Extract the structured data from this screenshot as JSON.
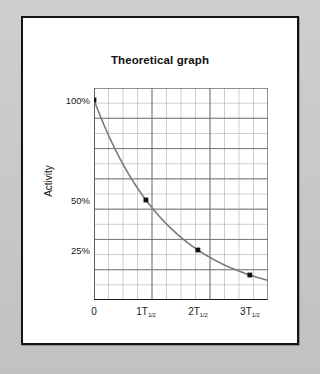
{
  "page": {
    "background_color": "#c9c9c9",
    "card_background": "#ffffff",
    "card_border_color": "#131313"
  },
  "chart_data": {
    "type": "line",
    "title": "Theoretical graph",
    "xlabel": "",
    "ylabel": "Activity",
    "grid": true,
    "legend": "none",
    "x_tick_labels": [
      "0",
      "1T1/2",
      "2T1/2",
      "3T1/2"
    ],
    "x_tick_display": [
      {
        "main": "0",
        "sub": ""
      },
      {
        "main": "1T",
        "sub": "1/2"
      },
      {
        "main": "2T",
        "sub": "1/2"
      },
      {
        "main": "3T",
        "sub": "1/2"
      }
    ],
    "x_tick_values": [
      0,
      1,
      2,
      3
    ],
    "xlim": [
      0,
      3.35
    ],
    "y_tick_labels": [
      "100%",
      "50%",
      "25%"
    ],
    "y_tick_values": [
      100,
      50,
      25
    ],
    "ylim": [
      0,
      106
    ],
    "x": [
      0,
      1,
      2,
      3
    ],
    "values": [
      100,
      50,
      25,
      12.5
    ],
    "series": [
      {
        "name": "Activity decay",
        "x": [
          0,
          1,
          2,
          3
        ],
        "values": [
          100,
          50,
          25,
          12.5
        ],
        "line_color": "#7a7a7a",
        "marker": "square",
        "marker_color": "#111111"
      }
    ],
    "curve_formula": "A = 100 * 0.5^(t / T_half)",
    "grid_columns": 12,
    "grid_rows": 14,
    "grid_minor_color": "#b9b9b9",
    "grid_major_color": "#6d6d6d",
    "axis_color": "#4a4a4a"
  },
  "icons": {
    "data_point_marker": "square-marker-icon"
  }
}
